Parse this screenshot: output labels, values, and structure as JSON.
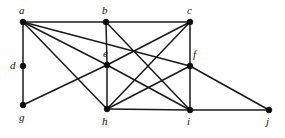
{
  "figure": {
    "type": "undirected-graph-diagram",
    "background_color": "#ffffff",
    "edge_color": "#1a1a1a",
    "vertex_color": "#0d0d0d",
    "label_color": "#141414",
    "width": 285,
    "height": 138
  },
  "graph": {
    "vertices": [
      {
        "id": "a",
        "label": "a",
        "x": 23,
        "y": 22,
        "label_x": 19,
        "label_y": 5,
        "degree": 6
      },
      {
        "id": "b",
        "label": "b",
        "x": 106,
        "y": 22,
        "label_x": 102,
        "label_y": 5,
        "degree": 4
      },
      {
        "id": "c",
        "label": "c",
        "x": 190,
        "y": 22,
        "label_x": 187,
        "label_y": 5,
        "degree": 5
      },
      {
        "id": "d",
        "label": "d",
        "x": 23,
        "y": 66,
        "label_x": 10,
        "label_y": 60,
        "degree": 2
      },
      {
        "id": "e",
        "label": "e",
        "x": 107,
        "y": 65,
        "label_x": 103,
        "label_y": 48,
        "degree": 6
      },
      {
        "id": "f",
        "label": "f",
        "x": 190,
        "y": 66,
        "label_x": 193,
        "label_y": 49,
        "degree": 5
      },
      {
        "id": "g",
        "label": "g",
        "x": 23,
        "y": 105,
        "label_x": 19,
        "label_y": 112,
        "degree": 2
      },
      {
        "id": "h",
        "label": "h",
        "x": 107,
        "y": 109,
        "label_x": 102,
        "label_y": 116,
        "degree": 5
      },
      {
        "id": "i",
        "label": "i",
        "x": 190,
        "y": 110,
        "label_x": 187,
        "label_y": 116,
        "degree": 5
      },
      {
        "id": "j",
        "label": "j",
        "x": 269,
        "y": 110,
        "label_x": 266,
        "label_y": 116,
        "degree": 2
      }
    ],
    "edges": [
      {
        "from": "a",
        "to": "b"
      },
      {
        "from": "b",
        "to": "c"
      },
      {
        "from": "a",
        "to": "d"
      },
      {
        "from": "d",
        "to": "g"
      },
      {
        "from": "b",
        "to": "e"
      },
      {
        "from": "e",
        "to": "h"
      },
      {
        "from": "c",
        "to": "f"
      },
      {
        "from": "f",
        "to": "i"
      },
      {
        "from": "h",
        "to": "i"
      },
      {
        "from": "i",
        "to": "j"
      },
      {
        "from": "a",
        "to": "e"
      },
      {
        "from": "a",
        "to": "f"
      },
      {
        "from": "a",
        "to": "h"
      },
      {
        "from": "c",
        "to": "e"
      },
      {
        "from": "c",
        "to": "h"
      },
      {
        "from": "b",
        "to": "i"
      },
      {
        "from": "g",
        "to": "e"
      },
      {
        "from": "e",
        "to": "i"
      },
      {
        "from": "h",
        "to": "f"
      },
      {
        "from": "f",
        "to": "j"
      }
    ]
  }
}
